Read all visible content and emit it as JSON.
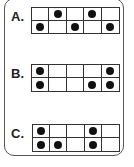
{
  "options": [
    {
      "label": "A.",
      "rows": [
        [
          0,
          1,
          0,
          1,
          0
        ],
        [
          1,
          0,
          1,
          0,
          1
        ]
      ]
    },
    {
      "label": "B.",
      "rows": [
        [
          1,
          0,
          0,
          0,
          1
        ],
        [
          1,
          0,
          0,
          1,
          1
        ]
      ]
    },
    {
      "label": "C.",
      "rows": [
        [
          1,
          0,
          0,
          1,
          0
        ],
        [
          1,
          1,
          0,
          1,
          0
        ]
      ]
    }
  ],
  "colors": {
    "border": "#333333",
    "dot": "#111111",
    "background": "#ffffff"
  }
}
